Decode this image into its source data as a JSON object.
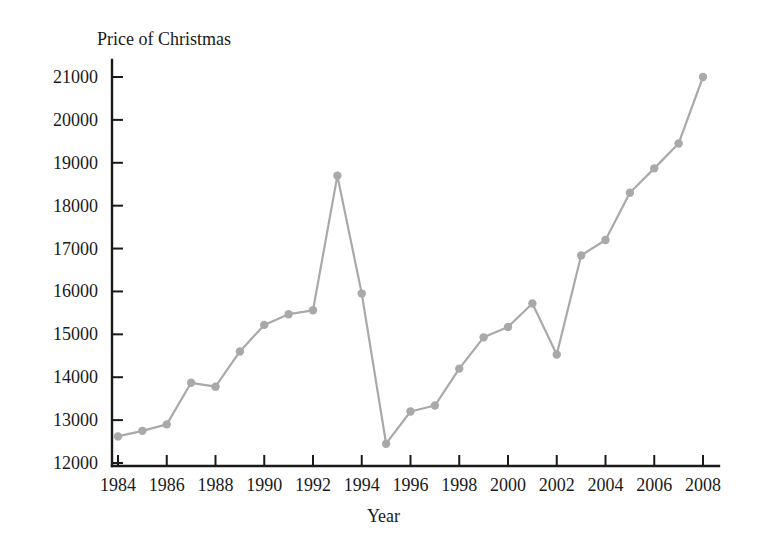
{
  "chart_data": {
    "type": "line",
    "title": "Price of Christmas",
    "xlabel": "Year",
    "ylabel": "",
    "xlim": [
      1983.5,
      2009.2
    ],
    "ylim": [
      12000,
      21400
    ],
    "grid": false,
    "legend": null,
    "series_color": "#a9a9a9",
    "axis_color": "#1a1a1a",
    "x_tick_labels": [
      "1984",
      "1986",
      "1988",
      "1990",
      "1992",
      "1994",
      "1996",
      "1998",
      "2000",
      "2002",
      "2004",
      "2006",
      "2008"
    ],
    "x_tick_values": [
      1984,
      1986,
      1988,
      1990,
      1992,
      1994,
      1996,
      1998,
      2000,
      2002,
      2004,
      2006,
      2008
    ],
    "y_tick_labels": [
      "12000",
      "13000",
      "14000",
      "15000",
      "16000",
      "17000",
      "18000",
      "19000",
      "20000",
      "21000"
    ],
    "y_tick_values": [
      12000,
      13000,
      14000,
      15000,
      16000,
      17000,
      18000,
      19000,
      20000,
      21000
    ],
    "x": [
      1984,
      1985,
      1986,
      1987,
      1988,
      1989,
      1990,
      1991,
      1992,
      1993,
      1994,
      1995,
      1996,
      1997,
      1998,
      1999,
      2000,
      2001,
      2002,
      2003,
      2004,
      2005,
      2006,
      2007,
      2008
    ],
    "values": [
      12620,
      12750,
      12900,
      13870,
      13780,
      14600,
      15220,
      15470,
      15560,
      18700,
      15950,
      12450,
      13200,
      13340,
      14200,
      14930,
      15170,
      15720,
      14530,
      16840,
      17200,
      18300,
      18870,
      19450,
      21000
    ],
    "categories": [
      "1984",
      "1985",
      "1986",
      "1987",
      "1988",
      "1989",
      "1990",
      "1991",
      "1992",
      "1993",
      "1994",
      "1995",
      "1996",
      "1997",
      "1998",
      "1999",
      "2000",
      "2001",
      "2002",
      "2003",
      "2004",
      "2005",
      "2006",
      "2007",
      "2008"
    ]
  }
}
